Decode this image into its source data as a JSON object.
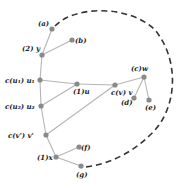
{
  "diagram": {
    "nodes": [
      {
        "id": "a",
        "x": 52,
        "y": 29,
        "label": "(a)",
        "lx": 38,
        "ly": 26
      },
      {
        "id": "b",
        "x": 72,
        "y": 40,
        "label": "(b)",
        "lx": 75,
        "ly": 43
      },
      {
        "id": "y",
        "x": 42,
        "y": 55,
        "label": "(2) y",
        "lx": 22,
        "ly": 51
      },
      {
        "id": "u1",
        "x": 40,
        "y": 80,
        "label": "c(u₁) u₁",
        "lx": 5,
        "ly": 83
      },
      {
        "id": "u",
        "x": 77,
        "y": 84,
        "label": "(1)u",
        "lx": 73,
        "ly": 94
      },
      {
        "id": "u2",
        "x": 41,
        "y": 106,
        "label": "c(u₂) u₂",
        "lx": 5,
        "ly": 109
      },
      {
        "id": "vp",
        "x": 46,
        "y": 135,
        "label": "c(v') v'",
        "lx": 8,
        "ly": 138
      },
      {
        "id": "f",
        "x": 79,
        "y": 147,
        "label": "(f)",
        "lx": 81,
        "ly": 150
      },
      {
        "id": "x",
        "x": 56,
        "y": 157,
        "label": "(1)x",
        "lx": 37,
        "ly": 160
      },
      {
        "id": "g",
        "x": 81,
        "y": 166,
        "label": "(g)",
        "lx": 76,
        "ly": 177
      },
      {
        "id": "v",
        "x": 115,
        "y": 85,
        "label": "c(v) v",
        "lx": 111,
        "ly": 95
      },
      {
        "id": "w",
        "x": 144,
        "y": 77,
        "label": "(c)w",
        "lx": 131,
        "ly": 71
      },
      {
        "id": "d",
        "x": 134,
        "y": 98,
        "label": "(d)",
        "lx": 121,
        "ly": 105
      },
      {
        "id": "e",
        "x": 149,
        "y": 100,
        "label": "(e)",
        "lx": 145,
        "ly": 110
      }
    ],
    "edges": [
      [
        "a",
        "y"
      ],
      [
        "b",
        "y"
      ],
      [
        "y",
        "u1"
      ],
      [
        "u1",
        "u"
      ],
      [
        "u",
        "v"
      ],
      [
        "u1",
        "u2"
      ],
      [
        "u2",
        "u"
      ],
      [
        "u2",
        "vp"
      ],
      [
        "vp",
        "v"
      ],
      [
        "vp",
        "x"
      ],
      [
        "x",
        "f"
      ],
      [
        "x",
        "g"
      ],
      [
        "v",
        "w"
      ],
      [
        "w",
        "d"
      ],
      [
        "w",
        "e"
      ]
    ],
    "dashed_curve": "M 55 26 C 75 5, 130 5, 155 30 C 180 60, 178 110, 150 135 C 130 155, 105 165, 85 167",
    "colors": {
      "node": "#8a8a8a",
      "edge": "#b5b5b5",
      "dash": "#333333",
      "label": "#222222"
    }
  }
}
